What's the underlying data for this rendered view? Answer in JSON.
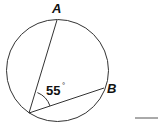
{
  "diagram": {
    "type": "inscribed-angle",
    "circle": {
      "cx": 57.5,
      "cy": 70.5,
      "r": 51
    },
    "points": {
      "A": {
        "label": "A",
        "x": 57,
        "y": 20
      },
      "B": {
        "label": "B",
        "x": 104,
        "y": 88
      },
      "vertex": {
        "x": 29,
        "y": 113
      }
    },
    "angle": {
      "value": "55",
      "unit": "°"
    },
    "answer_line": true
  }
}
